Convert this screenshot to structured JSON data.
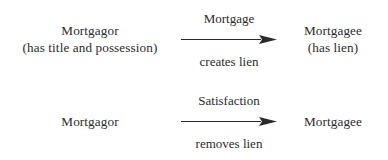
{
  "diagram": {
    "background_color": "#ffffff",
    "text_color": "#2b2b2b",
    "rows": [
      {
        "id": "mortgage",
        "left_party": {
          "name": "Mortgagor",
          "detail": "(has title and possession)"
        },
        "arrow": {
          "label_above": "Mortgage",
          "label_below": "creates lien",
          "direction": "right"
        },
        "right_party": {
          "name": "Mortgagee",
          "detail": "(has lien)"
        }
      },
      {
        "id": "satisfaction",
        "left_party": {
          "name": "Mortgagor",
          "detail": ""
        },
        "arrow": {
          "label_above": "Satisfaction",
          "label_below": "removes lien",
          "direction": "right"
        },
        "right_party": {
          "name": "Mortgagee",
          "detail": ""
        }
      }
    ]
  }
}
